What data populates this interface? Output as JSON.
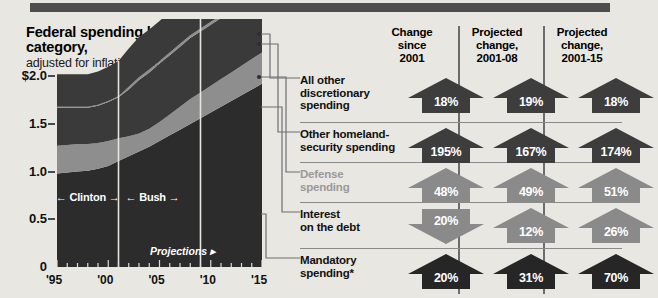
{
  "topbar": {
    "label": "top-rule"
  },
  "chart_data": {
    "type": "area",
    "title": "Federal spending by category,",
    "subtitle": "adjusted for inflation, in trillions",
    "ylabel": "",
    "xlabel": "",
    "ylim": [
      0,
      2.6
    ],
    "yticks": [
      "$2.0",
      "1.5",
      "1.0",
      "0.5",
      "0"
    ],
    "ytick_values": [
      2.0,
      1.5,
      1.0,
      0.5,
      0
    ],
    "xticks": [
      "'95",
      "'00",
      "'05",
      "'10",
      "'15"
    ],
    "xtick_values": [
      1995,
      2000,
      2005,
      2010,
      2015
    ],
    "xlim": [
      1995,
      2015
    ],
    "grid": false,
    "legend": "right-table",
    "x": [
      1995,
      1996,
      1997,
      1998,
      1999,
      2000,
      2001,
      2002,
      2003,
      2004,
      2005,
      2006,
      2007,
      2008,
      2009,
      2010,
      2011,
      2012,
      2013,
      2014,
      2015
    ],
    "series": [
      {
        "name": "Mandatory spending*",
        "values": [
          0.98,
          0.99,
          1.0,
          1.01,
          1.03,
          1.06,
          1.11,
          1.16,
          1.21,
          1.26,
          1.32,
          1.38,
          1.44,
          1.5,
          1.56,
          1.62,
          1.68,
          1.74,
          1.8,
          1.86,
          1.92
        ]
      },
      {
        "name": "Interest on the debt",
        "values": [
          0.29,
          0.29,
          0.29,
          0.28,
          0.27,
          0.26,
          0.24,
          0.21,
          0.19,
          0.19,
          0.2,
          0.22,
          0.24,
          0.26,
          0.27,
          0.28,
          0.29,
          0.3,
          0.31,
          0.32,
          0.33
        ]
      },
      {
        "name": "Defense spending",
        "values": [
          0.4,
          0.39,
          0.38,
          0.38,
          0.39,
          0.41,
          0.43,
          0.49,
          0.56,
          0.59,
          0.61,
          0.62,
          0.63,
          0.64,
          0.64,
          0.64,
          0.64,
          0.64,
          0.64,
          0.64,
          0.64
        ]
      },
      {
        "name": "Other homeland-security spending",
        "values": [
          0.01,
          0.01,
          0.01,
          0.01,
          0.01,
          0.01,
          0.01,
          0.03,
          0.03,
          0.03,
          0.03,
          0.03,
          0.03,
          0.03,
          0.03,
          0.03,
          0.03,
          0.03,
          0.03,
          0.03,
          0.03
        ]
      },
      {
        "name": "All other discretionary spending",
        "values": [
          0.34,
          0.34,
          0.34,
          0.34,
          0.35,
          0.36,
          0.37,
          0.4,
          0.42,
          0.42,
          0.42,
          0.42,
          0.42,
          0.43,
          0.43,
          0.43,
          0.43,
          0.43,
          0.43,
          0.43,
          0.43
        ]
      }
    ],
    "annotations": [
      {
        "text": "← Clinton →",
        "x": 1998.2,
        "y": 0.72
      },
      {
        "text": "← Bush →",
        "x": 2005.0,
        "y": 0.72
      },
      {
        "text": "Projections ▸",
        "x": 2007.0,
        "y": 0.16
      }
    ],
    "markers": [
      {
        "label": "era-divider-clinton-bush",
        "x": 2001
      },
      {
        "label": "era-divider-projections",
        "x": 2009
      }
    ],
    "colors": {
      "band_dark": "#3a3a3a",
      "band_mid": "#8e8e8e",
      "band_darkest": "#2c2c2c",
      "background": "#e8e7e2"
    }
  },
  "era_labels": {
    "clinton": "← Clinton →",
    "bush": "← Bush →",
    "projections": "Projections ▸"
  },
  "table": {
    "columns": [
      {
        "id": "change-since-2001",
        "line1": "Change",
        "line2": "since",
        "line3": "2001"
      },
      {
        "id": "projected-change-2001-08",
        "line1": "Projected",
        "line2": "change,",
        "line3": "2001-08"
      },
      {
        "id": "projected-change-2001-15",
        "line1": "Projected",
        "line2": "change,",
        "line3": "2001-15"
      }
    ],
    "rows": [
      {
        "id": "all-other-discretionary-spending",
        "label_lines": [
          "All other",
          "discretionary",
          "spending"
        ],
        "muted": false,
        "tone": "dark",
        "cells": [
          {
            "value": "18%",
            "direction": "up"
          },
          {
            "value": "19%",
            "direction": "up"
          },
          {
            "value": "18%",
            "direction": "up"
          }
        ]
      },
      {
        "id": "other-homeland-security-spending",
        "label_lines": [
          "Other homeland-",
          "security spending"
        ],
        "muted": false,
        "tone": "dark",
        "cells": [
          {
            "value": "195%",
            "direction": "up"
          },
          {
            "value": "167%",
            "direction": "up"
          },
          {
            "value": "174%",
            "direction": "up"
          }
        ]
      },
      {
        "id": "defense-spending",
        "label_lines": [
          "Defense",
          "spending"
        ],
        "muted": true,
        "tone": "mid",
        "cells": [
          {
            "value": "48%",
            "direction": "up"
          },
          {
            "value": "49%",
            "direction": "up"
          },
          {
            "value": "51%",
            "direction": "up"
          }
        ]
      },
      {
        "id": "interest-on-the-debt",
        "label_lines": [
          "Interest",
          "on the debt"
        ],
        "muted": false,
        "tone": "mid",
        "cells": [
          {
            "value": "20%",
            "direction": "down"
          },
          {
            "value": "12%",
            "direction": "up"
          },
          {
            "value": "26%",
            "direction": "up"
          }
        ]
      },
      {
        "id": "mandatory-spending",
        "label_lines": [
          "Mandatory",
          "spending*"
        ],
        "muted": false,
        "tone": "darkest",
        "cells": [
          {
            "value": "20%",
            "direction": "up"
          },
          {
            "value": "31%",
            "direction": "up"
          },
          {
            "value": "70%",
            "direction": "up"
          }
        ]
      }
    ]
  }
}
